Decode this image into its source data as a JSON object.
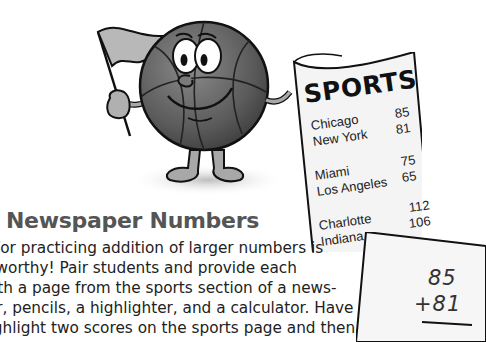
{
  "illustration": {
    "mascot": "basketball-character-holding-flag",
    "newspaper": {
      "title": "SPORTS",
      "games": [
        {
          "team1": "Chicago",
          "team2": "New York",
          "score1": "85",
          "score2": "81"
        },
        {
          "team1": "Miami",
          "team2": "Los Angeles",
          "score1": "75",
          "score2": "65"
        },
        {
          "team1": "Charlotte",
          "team2": "Indiana",
          "score1": "112",
          "score2": "106"
        }
      ]
    },
    "worksheet": {
      "top_number": "85",
      "bottom_number": "+81"
    }
  },
  "article": {
    "heading": "Newspaper Numbers",
    "lines": [
      "For practicing addition of larger numbers is",
      "newsworthy! Pair students and provide each",
      "pair with a page from the sports section of a news-",
      "paper, pencils, a highlighter, and a calculator. Have",
      "them highlight two scores on the sports page and then"
    ]
  }
}
